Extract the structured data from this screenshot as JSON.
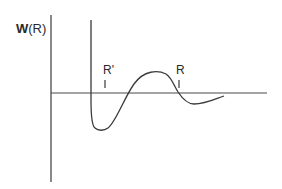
{
  "figure": {
    "y_axis_label": "W(R)",
    "markers": [
      {
        "label": "R'",
        "tick": "|"
      },
      {
        "label": "R",
        "tick": "|"
      }
    ]
  },
  "colors": {
    "line": "#3a3a3a",
    "text": "#2a2a2a",
    "background": "#ffffff"
  }
}
